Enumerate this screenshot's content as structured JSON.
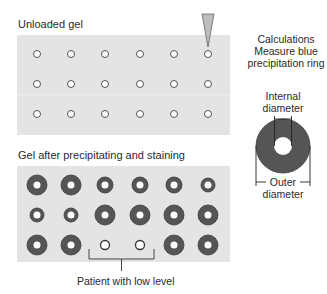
{
  "labels": {
    "unloaded_gel": "Unloaded gel",
    "gel_after": "Gel after precipitating and staining",
    "calc_line1": "Calculations",
    "calc_line2": "Measure blue",
    "calc_line3": "precipitation ring",
    "internal_line1": "Internal",
    "internal_line2": "diameter",
    "outer_line1": "Outer",
    "outer_line2": "diameter",
    "patient_low": "Patient with low level"
  },
  "colors": {
    "gel_background": "#e4e4e4",
    "ring": "#555555",
    "well_fill": "#ffffff",
    "well_stroke": "#555555",
    "pipette": "#bdbdbd"
  },
  "unloaded_gel": {
    "rows": 3,
    "cols": 6,
    "well_radius": 3.5
  },
  "stained_gel": {
    "rows": [
      [
        "large",
        "large",
        "medium",
        "medium",
        "medium",
        "small"
      ],
      [
        "small",
        "small",
        "large",
        "large",
        "large",
        "large"
      ],
      [
        "large",
        "large",
        "none",
        "none",
        "large",
        "large"
      ]
    ],
    "low_level_wells": [
      [
        2,
        2
      ],
      [
        2,
        3
      ]
    ]
  }
}
